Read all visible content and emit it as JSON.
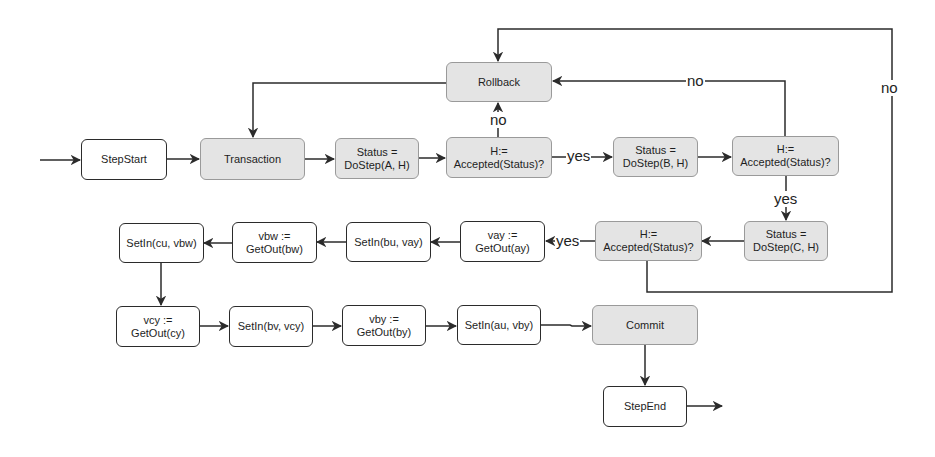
{
  "diagram": {
    "nodes": {
      "step_start": "StepStart",
      "transaction": "Transaction",
      "dostep_a": "Status =\nDoStep(A, H)",
      "accepted_a": "H:=\nAccepted(Status)?",
      "rollback": "Rollback",
      "dostep_b": "Status =\nDoStep(B, H)",
      "accepted_b": "H:=\nAccepted(Status)?",
      "dostep_c": "Status =\nDoStep(C, H)",
      "accepted_c": "H:=\nAccepted(Status)?",
      "getout_ay": "vay :=\nGetOut(ay)",
      "setin_bu_vay": "SetIn(bu, vay)",
      "getout_bw": "vbw :=\nGetOut(bw)",
      "setin_cu_vbw": "SetIn(cu, vbw)",
      "getout_cy": "vcy :=\nGetOut(cy)",
      "setin_bv_vcy": "SetIn(bv, vcy)",
      "getout_by": "vby :=\nGetOut(by)",
      "setin_au_vby": "SetIn(au, vby)",
      "commit": "Commit",
      "step_end": "StepEnd"
    },
    "edge_labels": {
      "a_no": "no",
      "a_yes": "yes",
      "b_no": "no",
      "b_yes": "yes",
      "c_yes": "yes",
      "c_no": "no"
    },
    "colors": {
      "stroke": "#2b2b2b",
      "shaded_fill": "#e4e4e4",
      "plain_fill": "#ffffff"
    }
  }
}
